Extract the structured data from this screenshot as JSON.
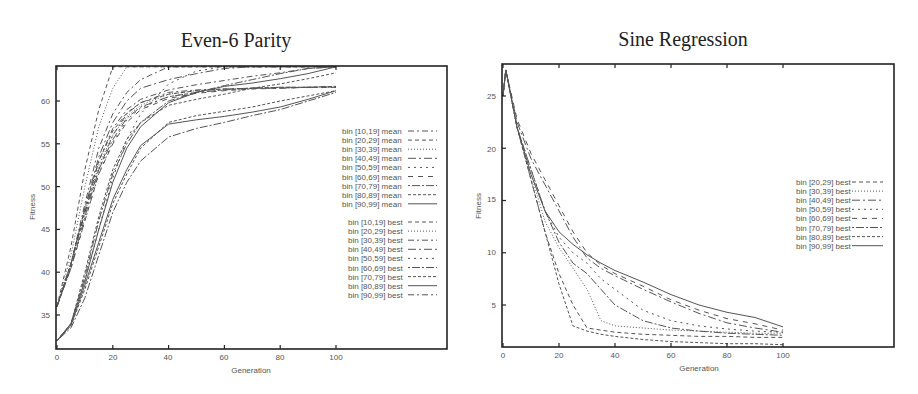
{
  "chart_data": [
    {
      "type": "line",
      "title": "Even-6 Parity",
      "xlabel": "Generation",
      "ylabel": "Fitness",
      "xlim": [
        0,
        140
      ],
      "ylim": [
        31,
        64
      ],
      "xticks": [
        0,
        20,
        40,
        60,
        80,
        100
      ],
      "yticks": [
        35,
        40,
        45,
        50,
        55,
        60
      ],
      "grid": false,
      "legend_position": "right",
      "x": [
        0,
        5,
        10,
        15,
        20,
        25,
        30,
        40,
        50,
        60,
        70,
        80,
        90,
        100
      ],
      "series": [
        {
          "name": "bin [10,19] mean",
          "dash": "6,3,2,3",
          "values": [
            36,
            41,
            47,
            52,
            56,
            58.5,
            59.8,
            61,
            61.3,
            61.4,
            61.5,
            61.5,
            61.6,
            61.6
          ]
        },
        {
          "name": "bin [20,29] mean",
          "dash": "4,3",
          "values": [
            36,
            41,
            47.5,
            53,
            56.5,
            58.6,
            59.8,
            60.8,
            61.2,
            61.4,
            61.5,
            61.6,
            61.6,
            61.7
          ]
        },
        {
          "name": "bin [30,39] mean",
          "dash": "1,2",
          "values": [
            36,
            41,
            47,
            52.5,
            56,
            58.2,
            59.5,
            60.8,
            61.2,
            61.4,
            61.5,
            61.6,
            61.6,
            61.7
          ]
        },
        {
          "name": "bin [40,49] mean",
          "dash": "8,3,2,3",
          "values": [
            36,
            40.5,
            46.5,
            52,
            55.5,
            58,
            59.3,
            60.5,
            61,
            61.3,
            61.5,
            61.6,
            61.6,
            61.7
          ]
        },
        {
          "name": "bin [50,59] mean",
          "dash": "2,4",
          "values": [
            36,
            40.5,
            46,
            51.5,
            55.2,
            57.8,
            59.2,
            60.5,
            61,
            61.3,
            61.5,
            61.5,
            61.6,
            61.6
          ]
        },
        {
          "name": "bin [60,69] mean",
          "dash": "5,5",
          "values": [
            36,
            40.5,
            46,
            51.5,
            55,
            57.5,
            59,
            60.3,
            60.9,
            61.2,
            61.4,
            61.5,
            61.6,
            61.6
          ]
        },
        {
          "name": "bin [70,79] mean",
          "dash": "2,2,8,2",
          "values": [
            32,
            33.5,
            37,
            42,
            47,
            50.5,
            53,
            55.8,
            56.8,
            57.5,
            58.3,
            59,
            60,
            61
          ]
        },
        {
          "name": "bin [80,89] mean",
          "dash": "3,2",
          "values": [
            32,
            33.8,
            38,
            43,
            48,
            51.5,
            54.5,
            57.5,
            58.3,
            58.8,
            59.3,
            60,
            60.6,
            61.2
          ]
        },
        {
          "name": "bin [90,99] mean",
          "dash": "",
          "values": [
            32,
            33.8,
            38.5,
            43.5,
            48.5,
            52,
            54.8,
            57.3,
            57.8,
            58.2,
            58.7,
            59.3,
            60.2,
            61.2
          ]
        },
        {
          "name": "bin [10,19] best",
          "dash": "4,3",
          "values": [
            36,
            43,
            52,
            59,
            64,
            64,
            64,
            64,
            64,
            64,
            64,
            64,
            64,
            64
          ]
        },
        {
          "name": "bin [20,29] best",
          "dash": "1,2",
          "values": [
            36,
            42,
            50,
            57,
            61.5,
            64,
            64,
            64,
            64,
            64,
            64,
            64,
            64,
            64
          ]
        },
        {
          "name": "bin [30,39] best",
          "dash": "6,3,2,3",
          "values": [
            36,
            41,
            48,
            54.5,
            58.5,
            61,
            62.5,
            64,
            64,
            64,
            64,
            64,
            64,
            64
          ]
        },
        {
          "name": "bin [40,49] best",
          "dash": "8,3,2,3",
          "values": [
            36,
            41,
            47.5,
            53.5,
            57.5,
            60,
            61.5,
            62.5,
            63.2,
            63.8,
            64,
            64,
            64,
            64
          ]
        },
        {
          "name": "bin [50,59] best",
          "dash": "2,4",
          "values": [
            32,
            34,
            39,
            45,
            51,
            55.5,
            58.5,
            62,
            63.5,
            64,
            64,
            64,
            64,
            64
          ]
        },
        {
          "name": "bin [60,69] best",
          "dash": "2,2,8,2",
          "values": [
            32,
            34,
            39.5,
            46,
            51.5,
            55,
            57.5,
            60,
            61,
            61.8,
            62.5,
            63.2,
            63.8,
            64
          ]
        },
        {
          "name": "bin [70,79] best",
          "dash": "3,2",
          "values": [
            32,
            34,
            40,
            46.5,
            52,
            55.5,
            57.5,
            59.5,
            60.2,
            60.8,
            61.5,
            62,
            62.6,
            63.3
          ]
        },
        {
          "name": "bin [80,89] best",
          "dash": "",
          "values": [
            32,
            34,
            39,
            45,
            50.5,
            54.5,
            57,
            59.8,
            61,
            61.7,
            62.1,
            62.6,
            63.2,
            64
          ]
        },
        {
          "name": "bin [90,99] best",
          "dash": "6,3,2,3",
          "values": [
            36,
            41,
            47,
            53,
            56.8,
            59,
            60.2,
            61.3,
            61.9,
            62.4,
            62.9,
            63.3,
            63.8,
            64
          ]
        }
      ]
    },
    {
      "type": "line",
      "title": "Sine Regression",
      "xlabel": "Generation",
      "ylabel": "Fitness",
      "xlim": [
        0,
        140
      ],
      "ylim": [
        1,
        28
      ],
      "xticks": [
        0,
        20,
        40,
        60,
        80,
        100
      ],
      "yticks": [
        5,
        10,
        15,
        20,
        25
      ],
      "grid": false,
      "legend_position": "right",
      "x": [
        0,
        1,
        5,
        10,
        15,
        20,
        25,
        30,
        35,
        40,
        50,
        60,
        70,
        80,
        90,
        100
      ],
      "series": [
        {
          "name": "bin [20,29] best",
          "dash": "4,3",
          "values": [
            25,
            27.5,
            22,
            17,
            12,
            8,
            5,
            2.8,
            2.6,
            2.4,
            2.2,
            2.1,
            2.0,
            2.0,
            1.9,
            1.9
          ]
        },
        {
          "name": "bin [30,39] best",
          "dash": "1,2",
          "values": [
            25,
            27.5,
            22,
            17.5,
            13,
            10.5,
            8.5,
            6.5,
            3.5,
            3.0,
            2.8,
            2.6,
            2.5,
            2.4,
            2.3,
            2.3
          ]
        },
        {
          "name": "bin [40,49] best",
          "dash": "8,3,2,3",
          "values": [
            25,
            27.5,
            22.5,
            19,
            16.5,
            14,
            11.5,
            9.5,
            8.5,
            7.8,
            6.5,
            5.3,
            4.2,
            3.3,
            2.8,
            2.4
          ]
        },
        {
          "name": "bin [50,59] best",
          "dash": "2,4",
          "values": [
            25,
            27.5,
            22,
            18,
            14,
            11.5,
            10,
            9,
            7.5,
            6.5,
            4.5,
            3.5,
            3.0,
            2.7,
            2.5,
            2.4
          ]
        },
        {
          "name": "bin [60,69] best",
          "dash": "5,5",
          "values": [
            25,
            27.5,
            22.8,
            19.5,
            17,
            14.5,
            12,
            10,
            8.8,
            8,
            6.8,
            5.5,
            4.5,
            3.7,
            3.2,
            2.6
          ]
        },
        {
          "name": "bin [70,79] best",
          "dash": "2,2,8,2",
          "values": [
            25,
            27.5,
            22,
            18,
            14,
            11,
            9,
            8,
            6.5,
            5,
            3.5,
            2.8,
            2.5,
            2.3,
            2.2,
            2.1
          ]
        },
        {
          "name": "bin [80,89] best",
          "dash": "3,2",
          "values": [
            25,
            27.5,
            22,
            17,
            12,
            7,
            3,
            2.5,
            2.2,
            2.0,
            1.7,
            1.5,
            1.4,
            1.3,
            1.3,
            1.2
          ]
        },
        {
          "name": "bin [90,99] best",
          "dash": "",
          "values": [
            25,
            27.5,
            22,
            17.5,
            14,
            12,
            10.8,
            9.8,
            9.0,
            8.3,
            7.2,
            6.0,
            5.0,
            4.3,
            3.8,
            2.9
          ]
        }
      ]
    }
  ],
  "left": {
    "title": "Even-6 Parity",
    "ylabel": "Fitness",
    "xlabel": "Generation",
    "xtick_labels": [
      "0",
      "20",
      "40",
      "60",
      "80",
      "100"
    ],
    "ytick_labels": [
      "35",
      "40",
      "45",
      "50",
      "55",
      "60"
    ],
    "legend_mean": [
      "bin [10,19] mean",
      "bin [20,29] mean",
      "bin [30,39] mean",
      "bin [40,49] mean",
      "bin [50,59] mean",
      "bin [60,69] mean",
      "bin [70,79] mean",
      "bin [80,89] mean",
      "bin [90,99] mean"
    ],
    "legend_best": [
      "bin [10,19] best",
      "bin [20,29] best",
      "bin [30,39] best",
      "bin [40,49] best",
      "bin [50,59] best",
      "bin [60,69] best",
      "bin [70,79] best",
      "bin [80,89] best",
      "bin [90,99] best"
    ]
  },
  "right": {
    "title": "Sine Regression",
    "ylabel": "Fitness",
    "xlabel": "Generation",
    "xtick_labels": [
      "0",
      "20",
      "40",
      "60",
      "80",
      "100"
    ],
    "ytick_labels": [
      "5",
      "10",
      "15",
      "20",
      "25"
    ],
    "legend_best": [
      "bin [20,29] best",
      "bin [30,39] best",
      "bin [40,49] best",
      "bin [50,59] best",
      "bin [60,69] best",
      "bin [70,79] best",
      "bin [80,89] best",
      "bin [90,99] best"
    ]
  },
  "colors": {
    "frame": "#222222",
    "line": "#555555",
    "text": "#555555"
  }
}
